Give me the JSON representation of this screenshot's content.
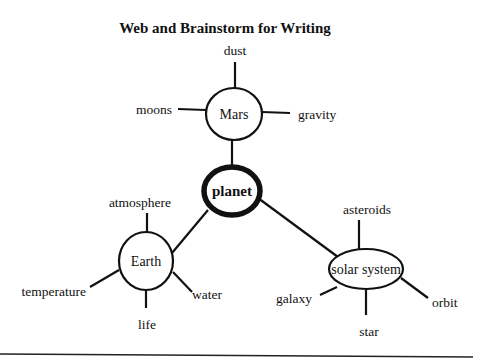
{
  "title": "Web and Brainstorm for Writing",
  "center": {
    "label": "planet"
  },
  "nodes": {
    "mars": {
      "label": "Mars",
      "leaves": {
        "dust": "dust",
        "moons": "moons",
        "gravity": "gravity"
      }
    },
    "earth": {
      "label": "Earth",
      "leaves": {
        "atmosphere": "atmosphere",
        "temperature": "temperature",
        "life": "life",
        "water": "water"
      }
    },
    "solar": {
      "label": "solar system",
      "leaves": {
        "asteroids": "asteroids",
        "galaxy": "galaxy",
        "star": "star",
        "orbit": "orbit"
      }
    }
  }
}
